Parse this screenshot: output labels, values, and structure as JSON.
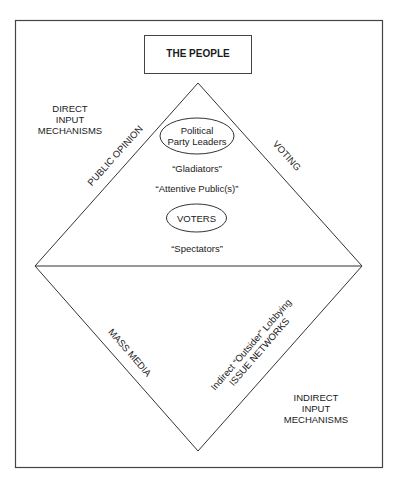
{
  "diagram": {
    "top_box": {
      "label": "THE PEOPLE"
    },
    "corner_labels": {
      "direct": [
        "DIRECT",
        "INPUT",
        "MECHANISMS"
      ],
      "indirect": [
        "INDIRECT",
        "INPUT",
        "MECHANISMS"
      ]
    },
    "edge_labels": {
      "upper_left": "PUBLIC OPINION",
      "upper_right": "VOTING",
      "lower_left": "MASS MEDIA",
      "lower_right_line1": "Indirect “Outsider” Lobbying",
      "lower_right_line2": "ISSUE NETWORKS"
    },
    "inner": {
      "leaders_ellipse": [
        "Political",
        "Party Leaders"
      ],
      "gladiators": "“Gladiators”",
      "attentive": "“Attentive Public(s)”",
      "voters_ellipse": "VOTERS",
      "spectators": "“Spectators”"
    },
    "colors": {
      "line": "#333333",
      "text": "#1a1a1a",
      "background": "#ffffff"
    }
  }
}
